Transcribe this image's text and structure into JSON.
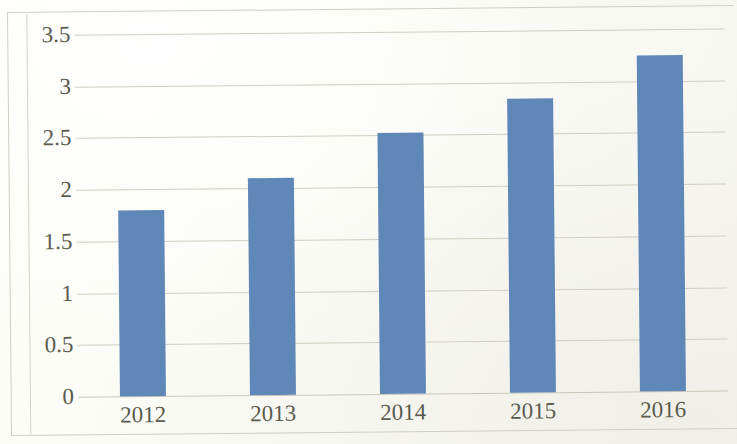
{
  "chart_data": {
    "type": "bar",
    "title": "",
    "subtitle": "",
    "xlabel": "",
    "ylabel": "",
    "categories": [
      "2012",
      "2013",
      "2014",
      "2015",
      "2016"
    ],
    "values": [
      1.8,
      2.1,
      2.52,
      2.84,
      3.25
    ],
    "series": [
      {
        "name": "",
        "values": [
          1.8,
          2.1,
          2.52,
          2.84,
          3.25
        ]
      }
    ],
    "ylim": [
      0,
      3.5
    ],
    "xlim_categories": 5,
    "y_ticks": [
      "0",
      "0.5",
      "1",
      "1.5",
      "2",
      "2.5",
      "3",
      "3.5"
    ],
    "y_tick_values": [
      0,
      0.5,
      1,
      1.5,
      2,
      2.5,
      3,
      3.5
    ],
    "grid": true,
    "grid_axis": "y",
    "legend": false,
    "legend_position": "none",
    "data_labels": false,
    "bar_color": "#5f87b8",
    "gridline_color": "#cfcfc0",
    "axis_text_color": "#595a4e",
    "background_color": "#fbfbf7",
    "frame_border_color": "#cfcfc4"
  }
}
